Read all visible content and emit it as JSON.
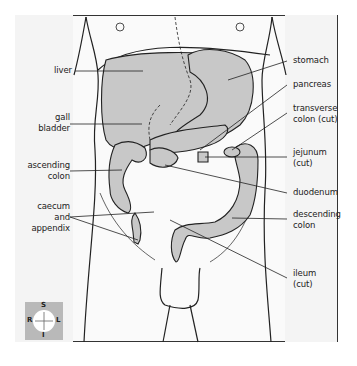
{
  "diagram": {
    "type": "anatomical-illustration",
    "labels_left": [
      {
        "id": "liver",
        "text": "liver"
      },
      {
        "id": "gall-bladder",
        "text": "gall\nbladder",
        "line1": "gall",
        "line2": "bladder"
      },
      {
        "id": "ascending-colon",
        "text": "ascending colon",
        "line1": "ascending",
        "line2": "colon"
      },
      {
        "id": "caecum-appendix",
        "text": "caecum and appendix",
        "line1": "caecum",
        "line2": "and",
        "line3": "appendix"
      }
    ],
    "labels_right": [
      {
        "id": "stomach",
        "text": "stomach"
      },
      {
        "id": "pancreas",
        "text": "pancreas"
      },
      {
        "id": "transverse-colon",
        "text": "transverse colon (cut)",
        "line1": "transverse",
        "line2": "colon (cut)"
      },
      {
        "id": "jejunum",
        "text": "jejunum (cut)",
        "line1": "jejunum",
        "line2": "(cut)"
      },
      {
        "id": "duodenum",
        "text": "duodenum"
      },
      {
        "id": "descending-colon",
        "text": "descending colon",
        "line1": "descending",
        "line2": "colon"
      },
      {
        "id": "ileum",
        "text": "ileum (cut)",
        "line1": "ileum",
        "line2": "(cut)"
      }
    ],
    "compass": {
      "top": "S",
      "bottom": "I",
      "left": "R",
      "right": "L"
    },
    "colors": {
      "organ_fill": "#c8c8c8",
      "outline": "#222222",
      "panel": "#f4f4f4",
      "compass_bg": "#b9b9b9"
    }
  }
}
